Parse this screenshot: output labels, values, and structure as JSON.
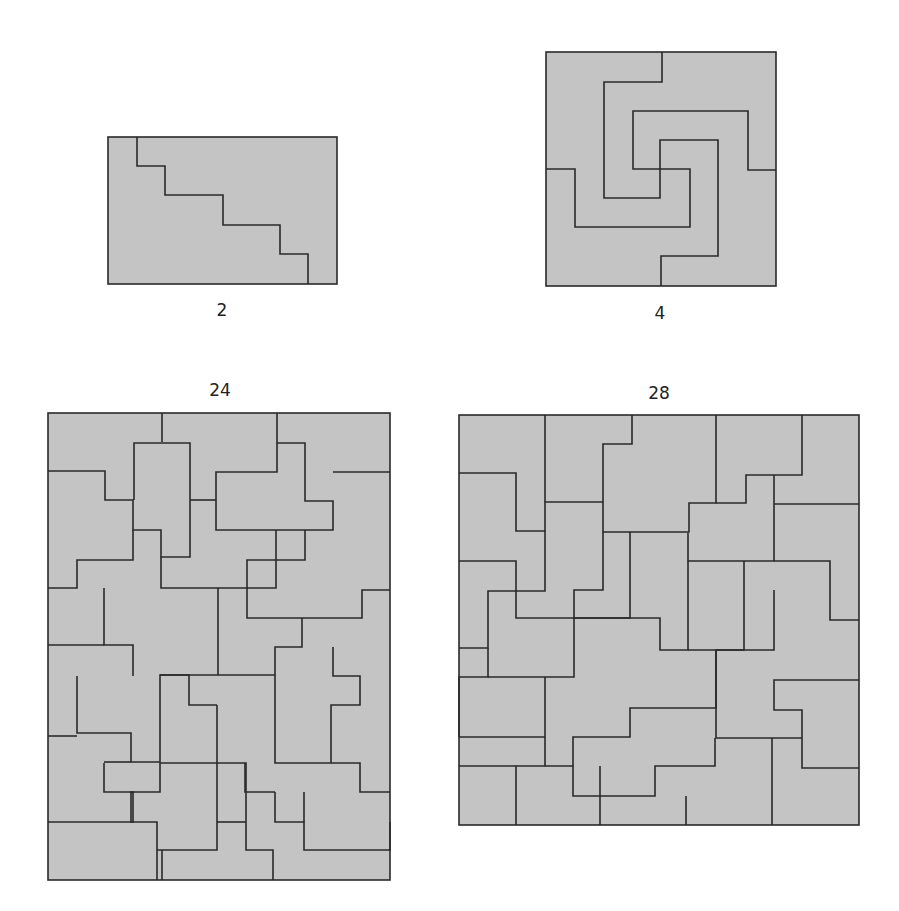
{
  "figures": [
    {
      "label": "2",
      "label_x": 222,
      "label_y": 300
    },
    {
      "label": "4",
      "label_x": 660,
      "label_y": 303
    },
    {
      "label": "24",
      "label_x": 220,
      "label_y": 380
    },
    {
      "label": "28",
      "label_x": 659,
      "label_y": 383
    }
  ],
  "colors": {
    "tile_fill": "#c4c4c4",
    "edge": "#2a2a2a",
    "background": "#ffffff"
  }
}
